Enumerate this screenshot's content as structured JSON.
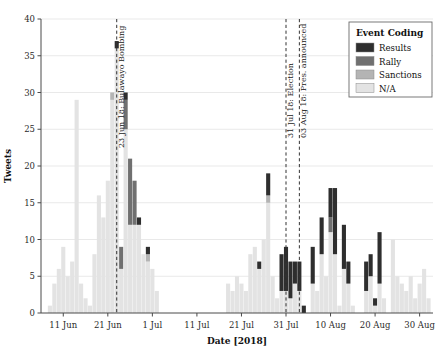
{
  "chart_data": {
    "type": "bar",
    "title": "",
    "subtitle": "",
    "xlabel": "Date [2018]",
    "ylabel": "Tweets",
    "stacked": true,
    "grid": true,
    "ylim": [
      0,
      40
    ],
    "ytick_values": [
      0,
      5,
      10,
      15,
      20,
      25,
      30,
      35,
      40
    ],
    "ytick_labels": [
      "0",
      "5",
      "10",
      "15",
      "20",
      "25",
      "30",
      "35",
      "40"
    ],
    "xlim": [
      "2018-06-06",
      "2018-09-02"
    ],
    "xtick_labels": [
      "11 Jun",
      "21 Jun",
      "1 Jul",
      "11 Jul",
      "21 Jul",
      "31 Jul",
      "10 Aug",
      "20 Aug",
      "30 Aug"
    ],
    "xtick_dates": [
      "2018-06-11",
      "2018-06-21",
      "2018-07-01",
      "2018-07-11",
      "2018-07-21",
      "2018-07-31",
      "2018-08-10",
      "2018-08-20",
      "2018-08-30"
    ],
    "legend": {
      "title": "Event Coding",
      "position": "top-right",
      "entries": [
        {
          "name": "Results",
          "color": "#2e2e2e"
        },
        {
          "name": "Rally",
          "color": "#707070"
        },
        {
          "name": "Sanctions",
          "color": "#b4b4b4"
        },
        {
          "name": "N/A",
          "color": "#e3e3e3"
        }
      ]
    },
    "series": [
      {
        "name": "N/A",
        "color": "#e3e3e3"
      },
      {
        "name": "Sanctions",
        "color": "#b4b4b4"
      },
      {
        "name": "Rally",
        "color": "#707070"
      },
      {
        "name": "Results",
        "color": "#2e2e2e"
      }
    ],
    "annotations": [
      {
        "date": "2018-06-23",
        "label": "23 Jun 18: Bulawayo Bombing",
        "style": "dashed-vline"
      },
      {
        "date": "2018-07-31",
        "label": "31 Jul 18: Election",
        "style": "dashed-vline"
      },
      {
        "date": "2018-08-03",
        "label": "03 Aug 18: Pres. announced",
        "style": "dashed-vline"
      }
    ],
    "bars": [
      {
        "date": "2018-06-08",
        "na": 1,
        "sanctions": 0,
        "rally": 0,
        "results": 0
      },
      {
        "date": "2018-06-09",
        "na": 4,
        "sanctions": 0,
        "rally": 0,
        "results": 0
      },
      {
        "date": "2018-06-10",
        "na": 6,
        "sanctions": 0,
        "rally": 0,
        "results": 0
      },
      {
        "date": "2018-06-11",
        "na": 9,
        "sanctions": 0,
        "rally": 0,
        "results": 0
      },
      {
        "date": "2018-06-12",
        "na": 5,
        "sanctions": 0,
        "rally": 0,
        "results": 0
      },
      {
        "date": "2018-06-13",
        "na": 7,
        "sanctions": 0,
        "rally": 0,
        "results": 0
      },
      {
        "date": "2018-06-14",
        "na": 29,
        "sanctions": 0,
        "rally": 0,
        "results": 0
      },
      {
        "date": "2018-06-15",
        "na": 4,
        "sanctions": 0,
        "rally": 0,
        "results": 0
      },
      {
        "date": "2018-06-16",
        "na": 2,
        "sanctions": 0,
        "rally": 0,
        "results": 0
      },
      {
        "date": "2018-06-17",
        "na": 1,
        "sanctions": 0,
        "rally": 0,
        "results": 0
      },
      {
        "date": "2018-06-18",
        "na": 8,
        "sanctions": 0,
        "rally": 0,
        "results": 0
      },
      {
        "date": "2018-06-19",
        "na": 16,
        "sanctions": 0,
        "rally": 0,
        "results": 0
      },
      {
        "date": "2018-06-20",
        "na": 13,
        "sanctions": 0,
        "rally": 0,
        "results": 0
      },
      {
        "date": "2018-06-21",
        "na": 18,
        "sanctions": 0,
        "rally": 0,
        "results": 0
      },
      {
        "date": "2018-06-22",
        "na": 29,
        "sanctions": 1,
        "rally": 0,
        "results": 0
      },
      {
        "date": "2018-06-23",
        "na": 36,
        "sanctions": 0,
        "rally": 0,
        "results": 1
      },
      {
        "date": "2018-06-24",
        "na": 6,
        "sanctions": 0,
        "rally": 3,
        "results": 0
      },
      {
        "date": "2018-06-25",
        "na": 25,
        "sanctions": 0,
        "rally": 4,
        "results": 1
      },
      {
        "date": "2018-06-26",
        "na": 12,
        "sanctions": 0,
        "rally": 9,
        "results": 0
      },
      {
        "date": "2018-06-27",
        "na": 12,
        "sanctions": 0,
        "rally": 6,
        "results": 0
      },
      {
        "date": "2018-06-28",
        "na": 12,
        "sanctions": 0,
        "rally": 0,
        "results": 1
      },
      {
        "date": "2018-06-29",
        "na": 8,
        "sanctions": 0,
        "rally": 0,
        "results": 0
      },
      {
        "date": "2018-06-30",
        "na": 7,
        "sanctions": 1,
        "rally": 0,
        "results": 1
      },
      {
        "date": "2018-07-01",
        "na": 6,
        "sanctions": 0,
        "rally": 0,
        "results": 0
      },
      {
        "date": "2018-07-02",
        "na": 3,
        "sanctions": 0,
        "rally": 0,
        "results": 0
      },
      {
        "date": "2018-07-18",
        "na": 4,
        "sanctions": 0,
        "rally": 0,
        "results": 0
      },
      {
        "date": "2018-07-19",
        "na": 3,
        "sanctions": 0,
        "rally": 0,
        "results": 0
      },
      {
        "date": "2018-07-20",
        "na": 5,
        "sanctions": 0,
        "rally": 0,
        "results": 0
      },
      {
        "date": "2018-07-21",
        "na": 4,
        "sanctions": 0,
        "rally": 0,
        "results": 0
      },
      {
        "date": "2018-07-22",
        "na": 3,
        "sanctions": 0,
        "rally": 0,
        "results": 0
      },
      {
        "date": "2018-07-23",
        "na": 8,
        "sanctions": 0,
        "rally": 0,
        "results": 0
      },
      {
        "date": "2018-07-24",
        "na": 9,
        "sanctions": 0,
        "rally": 0,
        "results": 0
      },
      {
        "date": "2018-07-25",
        "na": 6,
        "sanctions": 0,
        "rally": 0,
        "results": 1
      },
      {
        "date": "2018-07-26",
        "na": 10,
        "sanctions": 0,
        "rally": 0,
        "results": 0
      },
      {
        "date": "2018-07-27",
        "na": 15,
        "sanctions": 1,
        "rally": 0,
        "results": 3
      },
      {
        "date": "2018-07-28",
        "na": 5,
        "sanctions": 0,
        "rally": 0,
        "results": 0
      },
      {
        "date": "2018-07-29",
        "na": 2,
        "sanctions": 0,
        "rally": 0,
        "results": 0
      },
      {
        "date": "2018-07-30",
        "na": 3,
        "sanctions": 0,
        "rally": 0,
        "results": 5
      },
      {
        "date": "2018-07-31",
        "na": 3,
        "sanctions": 0,
        "rally": 0,
        "results": 6
      },
      {
        "date": "2018-08-01",
        "na": 2,
        "sanctions": 0,
        "rally": 0,
        "results": 5
      },
      {
        "date": "2018-08-02",
        "na": 4,
        "sanctions": 0,
        "rally": 0,
        "results": 3
      },
      {
        "date": "2018-08-03",
        "na": 3,
        "sanctions": 0,
        "rally": 0,
        "results": 4
      },
      {
        "date": "2018-08-04",
        "na": 0,
        "sanctions": 0,
        "rally": 0,
        "results": 1
      },
      {
        "date": "2018-08-06",
        "na": 4,
        "sanctions": 0,
        "rally": 0,
        "results": 5
      },
      {
        "date": "2018-08-07",
        "na": 3,
        "sanctions": 0,
        "rally": 0,
        "results": 0
      },
      {
        "date": "2018-08-08",
        "na": 8,
        "sanctions": 0,
        "rally": 0,
        "results": 5
      },
      {
        "date": "2018-08-09",
        "na": 5,
        "sanctions": 0,
        "rally": 0,
        "results": 0
      },
      {
        "date": "2018-08-10",
        "na": 11,
        "sanctions": 0,
        "rally": 2,
        "results": 4
      },
      {
        "date": "2018-08-11",
        "na": 8,
        "sanctions": 0,
        "rally": 0,
        "results": 9
      },
      {
        "date": "2018-08-12",
        "na": 1,
        "sanctions": 0,
        "rally": 0,
        "results": 0
      },
      {
        "date": "2018-08-13",
        "na": 6,
        "sanctions": 0,
        "rally": 0,
        "results": 6
      },
      {
        "date": "2018-08-14",
        "na": 4,
        "sanctions": 0,
        "rally": 0,
        "results": 3
      },
      {
        "date": "2018-08-15",
        "na": 1,
        "sanctions": 0,
        "rally": 0,
        "results": 0
      },
      {
        "date": "2018-08-18",
        "na": 3,
        "sanctions": 0,
        "rally": 0,
        "results": 4
      },
      {
        "date": "2018-08-19",
        "na": 5,
        "sanctions": 0,
        "rally": 0,
        "results": 3
      },
      {
        "date": "2018-08-20",
        "na": 1,
        "sanctions": 0,
        "rally": 0,
        "results": 1
      },
      {
        "date": "2018-08-21",
        "na": 4,
        "sanctions": 0,
        "rally": 0,
        "results": 7
      },
      {
        "date": "2018-08-22",
        "na": 2,
        "sanctions": 0,
        "rally": 0,
        "results": 0
      },
      {
        "date": "2018-08-24",
        "na": 10,
        "sanctions": 0,
        "rally": 0,
        "results": 0
      },
      {
        "date": "2018-08-25",
        "na": 5,
        "sanctions": 0,
        "rally": 0,
        "results": 0
      },
      {
        "date": "2018-08-26",
        "na": 4,
        "sanctions": 0,
        "rally": 0,
        "results": 0
      },
      {
        "date": "2018-08-27",
        "na": 3,
        "sanctions": 0,
        "rally": 0,
        "results": 0
      },
      {
        "date": "2018-08-28",
        "na": 5,
        "sanctions": 0,
        "rally": 0,
        "results": 0
      },
      {
        "date": "2018-08-29",
        "na": 2,
        "sanctions": 0,
        "rally": 0,
        "results": 0
      },
      {
        "date": "2018-08-30",
        "na": 4,
        "sanctions": 0,
        "rally": 0,
        "results": 0
      },
      {
        "date": "2018-08-31",
        "na": 6,
        "sanctions": 0,
        "rally": 0,
        "results": 0
      },
      {
        "date": "2018-09-01",
        "na": 2,
        "sanctions": 0,
        "rally": 0,
        "results": 0
      }
    ]
  }
}
